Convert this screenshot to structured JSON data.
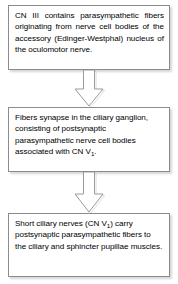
{
  "diagram": {
    "orientation": "vertical-top-to-bottom",
    "background_color": "#ffffff",
    "box_fill_color": "#ffffff",
    "box_border_color": "#8c8c8c",
    "text_color": "#000000",
    "arrow_fill_color": "#ffffff",
    "arrow_border_color": "#9a9a9a",
    "nodes": [
      {
        "id": "node-1",
        "order": 1,
        "text": "CN III contains parasympathetic fibers originating from nerve cell bodies of the accessory (Edinger-Westphal) nucleus of the oculomotor nerve.",
        "align": "justify"
      },
      {
        "id": "node-2",
        "order": 2,
        "text_before_subscript": "Fibers synapse in the ciliary ganglion, consisting of postsynaptic parasympathetic nerve cell bodies associated with CN V",
        "subscript": "1",
        "text_after_subscript": ".",
        "align": "left"
      },
      {
        "id": "node-3",
        "order": 3,
        "text_before_subscript": "Short ciliary nerves (CN V",
        "subscript": "1",
        "text_after_subscript": ") carry postsynaptic parasympathetic fibers to the ciliary and sphincter pupillae muscles.",
        "align": "left"
      }
    ],
    "connectors": [
      {
        "id": "arrow-1",
        "from": "node-1",
        "to": "node-2",
        "shape": "down-block-arrow"
      },
      {
        "id": "arrow-2",
        "from": "node-2",
        "to": "node-3",
        "shape": "down-block-arrow"
      }
    ]
  }
}
